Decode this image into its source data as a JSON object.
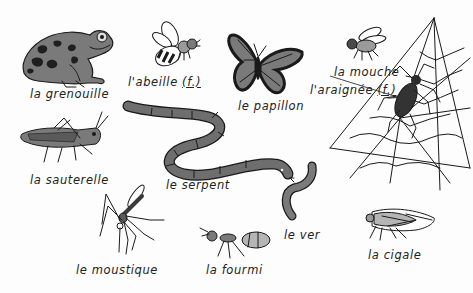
{
  "illustration": {
    "title": "French vocabulary: animals and insects",
    "colors": {
      "background": "#fdfdfd",
      "ink": "#1a1a1a",
      "grey_fill": "#7a7a7a",
      "light_fill": "#b5b5b5",
      "dark_fill": "#2b2b2b"
    },
    "items": [
      {
        "id": "frog",
        "label": "la grenouille",
        "gender": ""
      },
      {
        "id": "bee",
        "label": "l'abeille",
        "gender": "(f.)"
      },
      {
        "id": "butterfly",
        "label": "le papillon",
        "gender": ""
      },
      {
        "id": "fly",
        "label": "la mouche",
        "gender": ""
      },
      {
        "id": "spider",
        "label": "l'araignée",
        "gender": "(f.)"
      },
      {
        "id": "grasshopper",
        "label": "la sauterelle",
        "gender": ""
      },
      {
        "id": "snake",
        "label": "le serpent",
        "gender": ""
      },
      {
        "id": "worm",
        "label": "le ver",
        "gender": ""
      },
      {
        "id": "mosquito",
        "label": "le moustique",
        "gender": ""
      },
      {
        "id": "ant",
        "label": "la fourmi",
        "gender": ""
      },
      {
        "id": "cicada",
        "label": "la cigale",
        "gender": ""
      }
    ]
  }
}
